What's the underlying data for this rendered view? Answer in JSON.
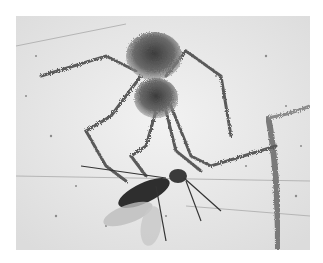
{
  "image": {
    "description": "Grayscale photograph of a spider in amber grasping an insect (wasp-like) with its legs",
    "subjects": [
      "spider",
      "insect"
    ],
    "colors": {
      "background": "#ffffff",
      "amber_light": "#ececec",
      "amber_mid": "#cfcfcf",
      "spider_dark": "#4a4a4a",
      "insect_dark": "#2e2e2e"
    }
  }
}
